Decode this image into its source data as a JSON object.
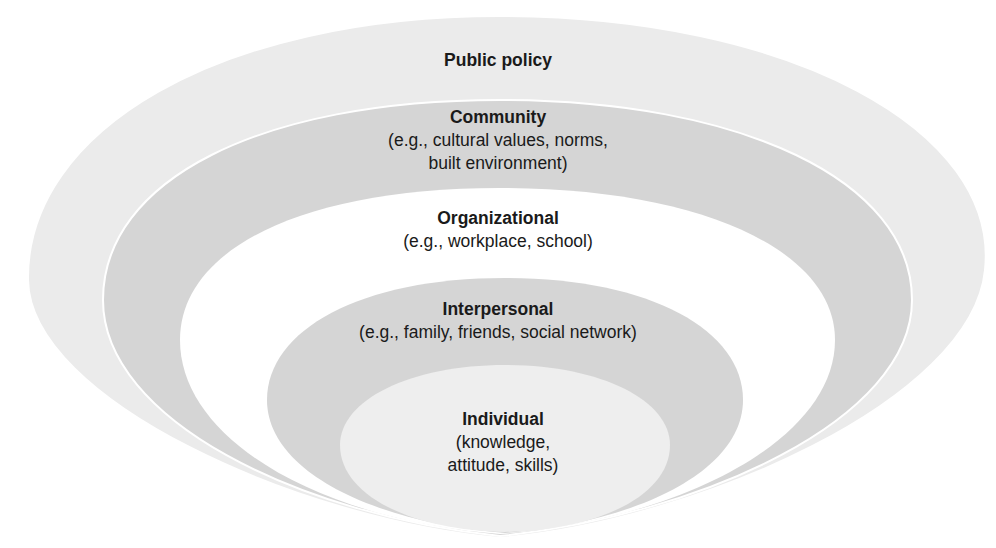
{
  "diagram": {
    "type": "nested-ellipses",
    "name": "Social ecological model",
    "layers": [
      {
        "title": "Public policy",
        "desc_lines": [],
        "fill": "#ebebeb"
      },
      {
        "title": "Community",
        "desc_lines": [
          "(e.g., cultural values, norms,",
          "built environment)"
        ],
        "fill": "#d5d5d5"
      },
      {
        "title": "Organizational",
        "desc_lines": [
          "(e.g., workplace, school)"
        ],
        "fill": "#ffffff"
      },
      {
        "title": "Interpersonal",
        "desc_lines": [
          "(e.g., family, friends, social network)"
        ],
        "fill": "#d5d5d5"
      },
      {
        "title": "Individual",
        "desc_lines": [
          "(knowledge,",
          "attitude, skills)"
        ],
        "fill": "#eeeeee"
      }
    ]
  }
}
